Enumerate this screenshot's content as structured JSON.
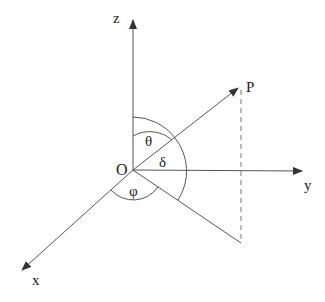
{
  "diagram": {
    "labels": {
      "z_axis": "z",
      "y_axis": "y",
      "x_axis": "x",
      "origin": "O",
      "point": "P",
      "theta": "θ",
      "delta": "δ",
      "phi": "φ"
    },
    "colors": {
      "stroke": "#444444",
      "text": "#222222",
      "background": "#ffffff"
    }
  }
}
